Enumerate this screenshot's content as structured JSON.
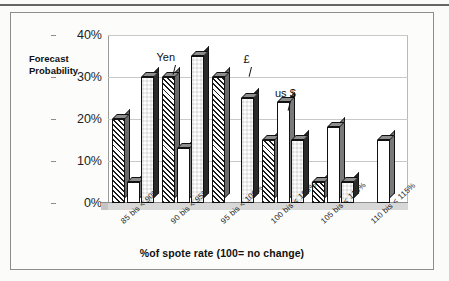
{
  "chart_data": {
    "type": "bar",
    "title": "",
    "xlabel": "%of spote rate (100= no change)",
    "ylabel": "Forecast\nProbability",
    "ylabel_line1": "Forecast",
    "ylabel_line2": "Probability",
    "ylim": [
      0,
      40
    ],
    "ytick_labels": [
      "0%",
      "10%",
      "20%",
      "30%",
      "40%"
    ],
    "ytick_values": [
      0,
      10,
      20,
      30,
      40
    ],
    "grid": true,
    "legend": "none",
    "categories": [
      "85 bis < 90%",
      "90 bis < 95%",
      "95 bis < 100%",
      "100 bis < 105%",
      "105 bis < 110%",
      "110 bis < 115%"
    ],
    "series": [
      {
        "name": "Yen",
        "pattern": "diagonal-hatch",
        "values": [
          20,
          30,
          30,
          15,
          5,
          0
        ]
      },
      {
        "name": "us $",
        "pattern": "white",
        "values": [
          5,
          13,
          0,
          24,
          18,
          15
        ]
      },
      {
        "name": "£",
        "pattern": "checkerboard",
        "values": [
          30,
          35,
          25,
          15,
          5,
          0
        ]
      }
    ],
    "annotations": [
      {
        "text": "Yen",
        "points_to_series": "Yen",
        "points_to_category": "90 bis < 95%"
      },
      {
        "text": "£",
        "points_to_series": "£",
        "points_to_category": "95 bis < 100%"
      },
      {
        "text": "us $",
        "points_to_series": "us $",
        "points_to_category": "100 bis < 105%"
      }
    ]
  },
  "colors": {
    "bar_outline": "#111111",
    "bar_side": "#6f6f6f",
    "gridline": "#c9c9c9",
    "axis": "#9a9a9a",
    "background": "#ffffff",
    "text": "#1a1a1a"
  }
}
